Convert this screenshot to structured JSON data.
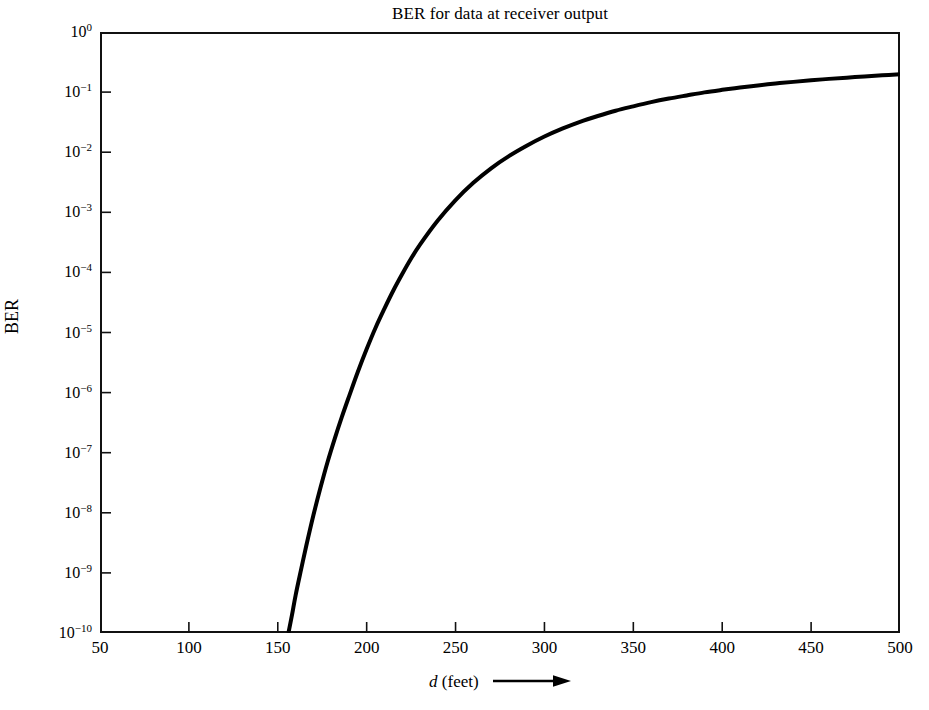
{
  "chart_data": {
    "type": "line",
    "title": "BER for data at receiver output",
    "xlabel": "d (feet)",
    "xlabel_variable": "d",
    "xlabel_units": "(feet)",
    "ylabel": "BER",
    "xlim": [
      50,
      500
    ],
    "ylim": [
      1e-10,
      1
    ],
    "yscale": "log",
    "xscale": "linear",
    "grid": false,
    "legend": null,
    "xticks": [
      50,
      100,
      150,
      200,
      250,
      300,
      350,
      400,
      450,
      500
    ],
    "xtick_labels": [
      "50",
      "100",
      "150",
      "200",
      "250",
      "300",
      "350",
      "400",
      "450",
      "500"
    ],
    "yticks": [
      1,
      0.1,
      0.01,
      0.001,
      0.0001,
      1e-05,
      1e-06,
      1e-07,
      1e-08,
      1e-09,
      1e-10
    ],
    "ytick_labels": [
      {
        "mantissa": "10",
        "exponent": "0"
      },
      {
        "mantissa": "10",
        "exponent": "−1"
      },
      {
        "mantissa": "10",
        "exponent": "−2"
      },
      {
        "mantissa": "10",
        "exponent": "−3"
      },
      {
        "mantissa": "10",
        "exponent": "−4"
      },
      {
        "mantissa": "10",
        "exponent": "−5"
      },
      {
        "mantissa": "10",
        "exponent": "−6"
      },
      {
        "mantissa": "10",
        "exponent": "−7"
      },
      {
        "mantissa": "10",
        "exponent": "−8"
      },
      {
        "mantissa": "10",
        "exponent": "−9"
      },
      {
        "mantissa": "10",
        "exponent": "−10"
      }
    ],
    "series": [
      {
        "name": "BER",
        "color": "#000000",
        "linewidth": 4,
        "x": [
          156,
          158,
          160,
          163,
          166,
          170,
          174,
          178,
          182,
          186,
          190,
          195,
          200,
          205,
          210,
          215,
          220,
          225,
          230,
          240,
          250,
          260,
          270,
          280,
          290,
          300,
          310,
          320,
          330,
          340,
          350,
          360,
          370,
          380,
          390,
          400,
          410,
          420,
          430,
          440,
          450,
          460,
          470,
          480,
          490,
          500
        ],
        "y": [
          1e-10,
          2e-10,
          4.2e-10,
          1.1e-09,
          2.8e-09,
          9e-09,
          2.6e-08,
          7e-08,
          1.7e-07,
          3.9e-07,
          8.5e-07,
          2.2e-06,
          5.3e-06,
          1.2e-05,
          2.5e-05,
          5e-05,
          9.4e-05,
          0.00017,
          0.00029,
          0.00073,
          0.0016,
          0.0031,
          0.0054,
          0.0086,
          0.0128,
          0.0182,
          0.0246,
          0.032,
          0.04,
          0.049,
          0.058,
          0.068,
          0.078,
          0.088,
          0.099,
          0.109,
          0.119,
          0.129,
          0.139,
          0.148,
          0.157,
          0.166,
          0.174,
          0.182,
          0.19,
          0.198
        ]
      }
    ],
    "annotations": [
      {
        "name": "x-axis-arrow",
        "symbol": "⟶",
        "meaning": "increasing distance"
      }
    ]
  }
}
